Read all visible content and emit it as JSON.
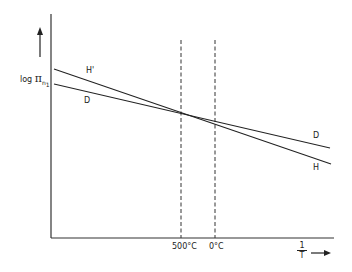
{
  "diagram": {
    "y_axis": {
      "label_prefix": "log",
      "label_symbol": "π",
      "label_subscript": "n",
      "label_subsubscript": "1",
      "arrow": "up-arrow"
    },
    "x_axis": {
      "label_numerator": "1",
      "label_denominator": "T",
      "arrow": "right-arrow"
    },
    "markers": [
      {
        "label": "500°C",
        "style": "dashed"
      },
      {
        "label": "0°C",
        "style": "dashed"
      }
    ],
    "lines": [
      {
        "name": "H",
        "left_label": "H'",
        "right_label": "H"
      },
      {
        "name": "D",
        "left_label": "D",
        "right_label": "D"
      }
    ],
    "colors": {
      "ink": "#222222",
      "background": "#ffffff"
    }
  }
}
